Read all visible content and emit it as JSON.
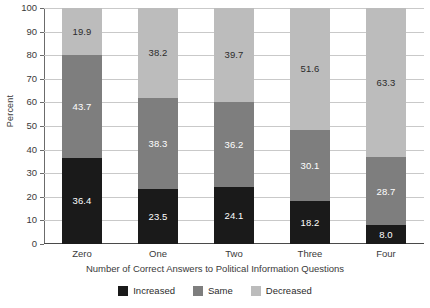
{
  "chart_data": {
    "type": "bar",
    "subtype": "stacked-bar-100",
    "title": "",
    "xlabel": "Number of Correct Answers to Political Information Questions",
    "ylabel": "Percent",
    "ylim": [
      0,
      100
    ],
    "yticks": [
      0,
      10,
      20,
      30,
      40,
      50,
      60,
      70,
      80,
      90,
      100
    ],
    "ytick_labels": [
      "0",
      "10",
      "20",
      "30",
      "40",
      "50",
      "60",
      "70",
      "80",
      "90",
      "100"
    ],
    "grid": true,
    "legend_position": "bottom",
    "categories": [
      "Zero",
      "One",
      "Two",
      "Three",
      "Four"
    ],
    "series": [
      {
        "name": "Increased",
        "color": "#1a1a1a",
        "values": [
          36.4,
          23.5,
          24.1,
          18.2,
          8.0
        ],
        "labels": [
          "36.4",
          "23.5",
          "24.1",
          "18.2",
          "8.0"
        ]
      },
      {
        "name": "Same",
        "color": "#7e7e7e",
        "values": [
          43.7,
          38.3,
          36.2,
          30.1,
          28.7
        ],
        "labels": [
          "43.7",
          "38.3",
          "36.2",
          "30.1",
          "28.7"
        ]
      },
      {
        "name": "Decreased",
        "color": "#bcbcbc",
        "values": [
          19.9,
          38.2,
          39.7,
          51.6,
          63.3
        ],
        "labels": [
          "19.9",
          "38.2",
          "39.7",
          "51.6",
          "63.3"
        ]
      }
    ]
  },
  "legend": {
    "items": [
      {
        "label": "Increased",
        "key": "increased"
      },
      {
        "label": "Same",
        "key": "same"
      },
      {
        "label": "Decreased",
        "key": "decreased"
      }
    ]
  }
}
